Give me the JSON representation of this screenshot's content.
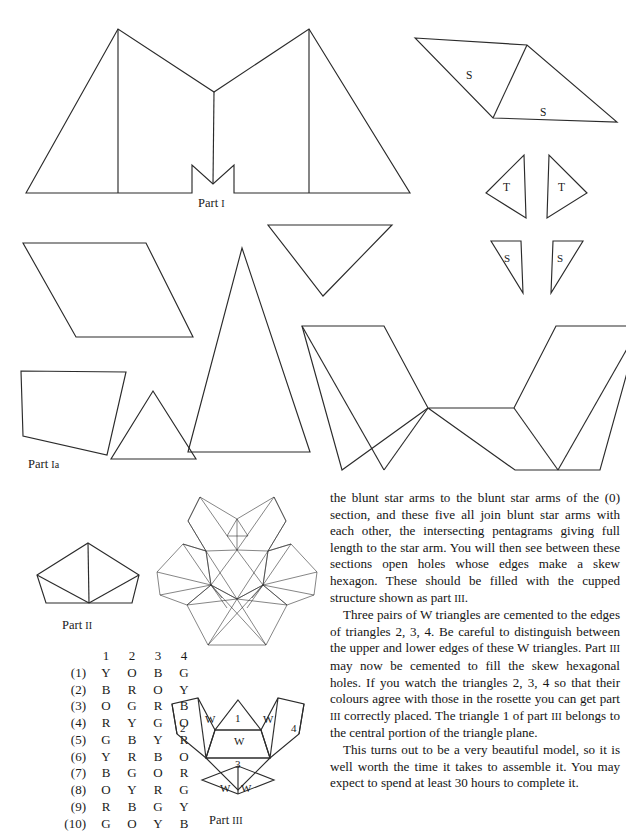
{
  "page": {
    "background": "#ffffff",
    "ink": "#2b2b2b"
  },
  "figures": {
    "part1": {
      "caption_text": "Part ",
      "caption_numeral": "I",
      "label_names": []
    },
    "part1a": {
      "caption_text": "Part ",
      "caption_numeral": "Ia"
    },
    "part2": {
      "caption_text": "Part ",
      "caption_numeral": "II"
    },
    "part3": {
      "caption_text": "Part ",
      "caption_numeral": "III",
      "labels": [
        "2",
        "W",
        "1",
        "W",
        "4",
        "W",
        "3",
        "W",
        "W"
      ]
    },
    "s_pair": {
      "label_left": "S",
      "label_right": "S"
    },
    "t_pair": {
      "label_left": "T",
      "label_right": "T"
    },
    "s_small_pair": {
      "label_left": "S",
      "label_right": "S"
    }
  },
  "color_table": {
    "column_headers": [
      "1",
      "2",
      "3",
      "4"
    ],
    "rows": [
      {
        "label": "(1)",
        "values": [
          "Y",
          "O",
          "B",
          "G"
        ]
      },
      {
        "label": "(2)",
        "values": [
          "B",
          "R",
          "O",
          "Y"
        ]
      },
      {
        "label": "(3)",
        "values": [
          "O",
          "G",
          "R",
          "B"
        ]
      },
      {
        "label": "(4)",
        "values": [
          "R",
          "Y",
          "G",
          "O"
        ]
      },
      {
        "label": "(5)",
        "values": [
          "G",
          "B",
          "Y",
          "R"
        ]
      },
      {
        "label": "(6)",
        "values": [
          "Y",
          "R",
          "B",
          "O"
        ]
      },
      {
        "label": "(7)",
        "values": [
          "B",
          "G",
          "O",
          "R"
        ]
      },
      {
        "label": "(8)",
        "values": [
          "O",
          "Y",
          "R",
          "G"
        ]
      },
      {
        "label": "(9)",
        "values": [
          "R",
          "B",
          "G",
          "Y"
        ]
      },
      {
        "label": "(10)",
        "values": [
          "G",
          "O",
          "Y",
          "B"
        ]
      }
    ]
  },
  "body_text": {
    "paragraph_1": "the blunt star arms to the blunt star arms of the (0) section, and these five all join blunt star arms with each other, the intersecting pentagrams giving full length to the star arm. You will then see between these sections open holes whose edges make a skew hexagon. These should be filled with the cupped structure shown as part ",
    "paragraph_1_numeral": "III",
    "paragraph_1_tail": ".",
    "paragraph_2_a": "Three pairs of W triangles are cemented to the edges of triangles 2, 3, 4. Be careful to distinguish between the upper and lower edges of these W triangles. Part ",
    "paragraph_2_numeral_a": "III",
    "paragraph_2_b": " may now be cemented to fill the skew hexagonal holes. If you watch the triangles 2, 3, 4 so that their colours agree with those in the rosette you can get part ",
    "paragraph_2_numeral_b": "III",
    "paragraph_2_c": " correctly placed. The triangle 1 of part ",
    "paragraph_2_numeral_c": "III",
    "paragraph_2_d": " belongs to the central portion of the triangle plane.",
    "paragraph_3": "This turns out to be a very beautiful model, so it is well worth the time it takes to assemble it. You may expect to spend at least 30 hours to complete it."
  }
}
